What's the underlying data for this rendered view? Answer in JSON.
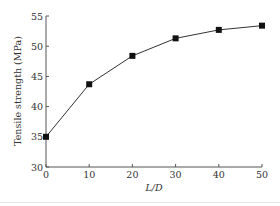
{
  "chart_data": {
    "type": "line",
    "title": "",
    "xlabel": "L/D",
    "ylabel": "Tensile strength (MPa)",
    "x": [
      0,
      10,
      20,
      30,
      40,
      50
    ],
    "series": [
      {
        "name": "Tensile strength",
        "values": [
          35.0,
          43.7,
          48.4,
          51.3,
          52.7,
          53.4
        ],
        "marker": "square"
      }
    ],
    "xlim": [
      0,
      50
    ],
    "ylim": [
      30,
      55
    ],
    "xticks": [
      0,
      10,
      20,
      30,
      40,
      50
    ],
    "yticks": [
      30,
      35,
      40,
      45,
      50,
      55
    ],
    "grid": false,
    "legend": null
  }
}
